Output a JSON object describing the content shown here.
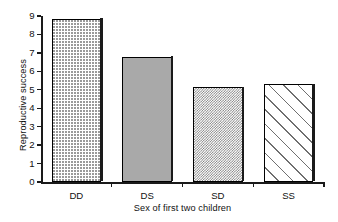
{
  "chart_data": {
    "type": "bar",
    "title": "",
    "xlabel": "Sex of first two children",
    "ylabel": "Reproductive success",
    "categories": [
      "DD",
      "DS",
      "SD",
      "SS"
    ],
    "values": [
      8.85,
      6.8,
      5.15,
      5.3
    ],
    "ylim": [
      0,
      9
    ],
    "yticks": [
      0,
      1,
      2,
      3,
      4,
      5,
      6,
      7,
      8,
      9
    ],
    "ytick_labels": [
      "0",
      "1",
      "2",
      "3",
      "4",
      "5",
      "6",
      "7",
      "8",
      "9"
    ],
    "grid": false,
    "legend": null,
    "bar_patterns": [
      "dots",
      "solid-gray",
      "dense-checker",
      "diagonal-hatch"
    ],
    "bar_edge_color": "#000000",
    "series": [
      {
        "name": "Reproductive success",
        "values": [
          8.85,
          6.8,
          5.15,
          5.3
        ]
      }
    ]
  },
  "axes": {
    "y_title": "Reproductive success",
    "x_title": "Sex of first two children"
  }
}
